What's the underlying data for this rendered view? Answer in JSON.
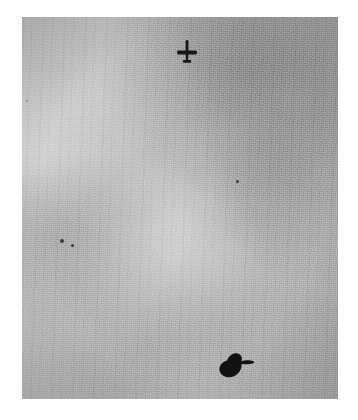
{
  "image": {
    "kind": "aerial-photograph",
    "medium": "black-and-white photographic print",
    "orientation": "portrait",
    "caption": "",
    "alt_text": "Grainy black-and-white aerial photograph showing a small aircraft silhouette near the top and a larger dark object with shadow near the lower right, on an otherwise featureless light grey surface"
  },
  "page": {
    "background_color": "#ffffff",
    "margin_color": "#ffffff"
  },
  "print": {
    "border_color": "#ffffff",
    "base_tone": "#c4c4c4",
    "light_tone": "#d6d6d6",
    "dark_tone": "#a8a8a8",
    "grain": "heavy fine-grain film emulsion"
  },
  "objects": [
    {
      "id": "aircraft-upper",
      "label": "aircraft",
      "description": "small aircraft plan-view silhouette with straight wings and tailplane",
      "color": "#1a1a1a",
      "x": 176,
      "y": 39,
      "width": 22,
      "height": 26
    },
    {
      "id": "dark-object-lower",
      "label": "dark object",
      "description": "larger irregular dark blob, aircraft-like with cast shadow",
      "color": "#141414",
      "x": 214,
      "y": 346,
      "width": 44,
      "height": 40
    },
    {
      "id": "speck-a",
      "label": "dark speck",
      "description": "small dark speck",
      "color": "#3a3a3a",
      "x": 60,
      "y": 239,
      "width": 4,
      "height": 4
    },
    {
      "id": "speck-b",
      "label": "dark speck",
      "description": "small dark speck",
      "color": "#3a3a3a",
      "x": 71,
      "y": 244,
      "width": 3,
      "height": 3
    },
    {
      "id": "speck-c",
      "label": "dark speck",
      "description": "small dark speck near centre right",
      "color": "#3a3a3a",
      "x": 236,
      "y": 180,
      "width": 3,
      "height": 3
    },
    {
      "id": "speck-d",
      "label": "dark speck",
      "description": "faint speck near upper left edge",
      "color": "#5a5a5a",
      "x": 26,
      "y": 100,
      "width": 2,
      "height": 2
    }
  ],
  "frame": {
    "left": 22,
    "top": 17,
    "width": 316,
    "height": 382
  }
}
